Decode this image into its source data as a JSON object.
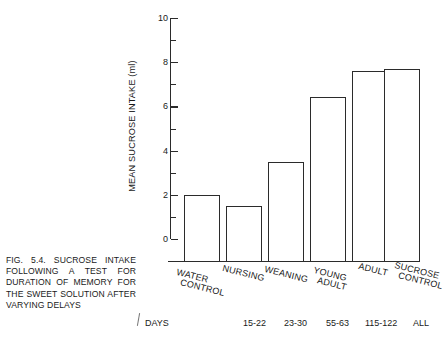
{
  "figure": {
    "caption": "FIG. 5.4. SUCROSE INTAKE FOLLOWING A TEST FOR DURATION OF MEMORY FOR THE SWEET SOLUTION AFTER VARYING DELAYS"
  },
  "axes": {
    "ylabel": "MEAN SUCROSE INTAKE (ml)",
    "yticks": [
      "0",
      "2",
      "4",
      "6",
      "8",
      "10"
    ],
    "days_row_label": "DAYS"
  },
  "chart_data": {
    "type": "bar",
    "title": "FIG. 5.4. SUCROSE INTAKE FOLLOWING A TEST FOR DURATION OF MEMORY FOR THE SWEET SOLUTION AFTER VARYING DELAYS",
    "xlabel": "",
    "ylabel": "MEAN SUCROSE INTAKE (ml)",
    "ylim": [
      0,
      10
    ],
    "ytick_values": [
      0,
      2,
      4,
      6,
      8,
      10
    ],
    "yminor_tick_values": [
      1,
      3,
      5,
      7,
      9
    ],
    "grid": false,
    "legend": "none",
    "categories": [
      "WATER CONTROL",
      "NURSING",
      "WEANING",
      "YOUNG ADULT",
      "ADULT",
      "SUCROSE CONTROL"
    ],
    "category_lines": [
      [
        "WATER",
        "CONTROL"
      ],
      [
        "NURSING",
        ""
      ],
      [
        "WEANING",
        ""
      ],
      [
        "YOUNG",
        "ADULT"
      ],
      [
        "ADULT",
        ""
      ],
      [
        "SUCROSE",
        "CONTROL"
      ]
    ],
    "days": [
      "",
      "15-22",
      "23-30",
      "55-63",
      "115-122",
      "ALL"
    ],
    "values": [
      3.0,
      2.5,
      4.5,
      7.4,
      8.6,
      8.7
    ],
    "units": "ml"
  }
}
